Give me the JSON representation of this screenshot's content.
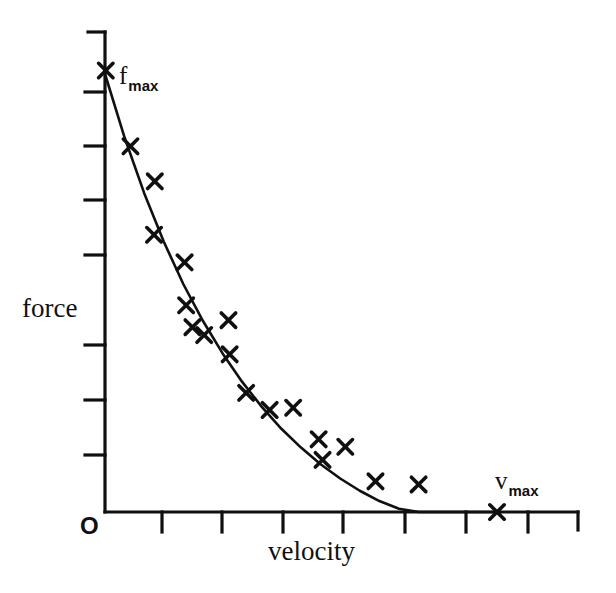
{
  "figure": {
    "kind": "force-velocity-curve",
    "background_color": "#ffffff",
    "ink_color": "#101010"
  },
  "labels": {
    "y_axis": "force",
    "x_axis": "velocity",
    "origin": "O",
    "fmax_base": "f",
    "fmax_sub": "max",
    "vmax_base": "v",
    "vmax_sub": "max"
  },
  "chart_data": {
    "type": "scatter",
    "title": "",
    "xlabel": "velocity",
    "ylabel": "force",
    "grid": false,
    "legend": false,
    "xlim": [
      0,
      1.2
    ],
    "ylim": [
      0,
      1.15
    ],
    "axis_ticks_labeled": false,
    "x_tick_count": 8,
    "y_tick_count": 7,
    "annotations": [
      {
        "text": "f max",
        "x": 0.0,
        "y": 1.0,
        "note": "maximum isometric force at zero velocity"
      },
      {
        "text": "v max",
        "x": 1.0,
        "y": 0.0,
        "note": "maximum shortening velocity at zero force"
      },
      {
        "text": "O",
        "x": 0.0,
        "y": 0.0,
        "note": "origin"
      }
    ],
    "series": [
      {
        "name": "fitted hyperbola",
        "type": "line",
        "x": [
          0.0,
          0.05,
          0.1,
          0.15,
          0.2,
          0.25,
          0.3,
          0.35,
          0.4,
          0.45,
          0.5,
          0.55,
          0.6,
          0.65,
          0.7,
          0.75,
          0.8,
          0.85,
          0.9,
          0.95,
          1.0
        ],
        "y": [
          1.0,
          0.855,
          0.728,
          0.617,
          0.52,
          0.436,
          0.362,
          0.297,
          0.24,
          0.19,
          0.147,
          0.109,
          0.0765,
          0.0485,
          0.025,
          0.0075,
          0.0,
          0.0,
          0.0,
          0.0,
          0.0
        ]
      },
      {
        "name": "measured points",
        "type": "scatter",
        "marker": "x",
        "points": [
          {
            "x": 0.002,
            "y": 1.008
          },
          {
            "x": 0.065,
            "y": 0.835
          },
          {
            "x": 0.127,
            "y": 0.755
          },
          {
            "x": 0.125,
            "y": 0.633
          },
          {
            "x": 0.203,
            "y": 0.57
          },
          {
            "x": 0.207,
            "y": 0.472
          },
          {
            "x": 0.223,
            "y": 0.422
          },
          {
            "x": 0.253,
            "y": 0.404
          },
          {
            "x": 0.315,
            "y": 0.438
          },
          {
            "x": 0.318,
            "y": 0.36
          },
          {
            "x": 0.36,
            "y": 0.272
          },
          {
            "x": 0.42,
            "y": 0.233
          },
          {
            "x": 0.48,
            "y": 0.238
          },
          {
            "x": 0.545,
            "y": 0.166
          },
          {
            "x": 0.555,
            "y": 0.119
          },
          {
            "x": 0.613,
            "y": 0.149
          },
          {
            "x": 0.69,
            "y": 0.07
          },
          {
            "x": 0.8,
            "y": 0.063
          },
          {
            "x": 1.0,
            "y": 0.0
          }
        ]
      }
    ]
  }
}
